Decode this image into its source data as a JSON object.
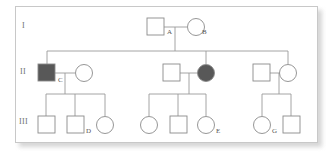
{
  "figure": {
    "type": "pedigree-chart",
    "background": "#ffffff",
    "frame_border_color": "#c8c8c8",
    "symbol_stroke_color": "#8a8a8a",
    "line_color": "#9a9a9a",
    "affected_fill_color": "#585858",
    "unaffected_fill_color": "#ffffff",
    "label_color": "#555555"
  },
  "generations": [
    {
      "id": "gen-1",
      "numeral": "I"
    },
    {
      "id": "gen-2",
      "numeral": "II"
    },
    {
      "id": "gen-3",
      "numeral": "III"
    }
  ],
  "legend_semantics": {
    "square": "male",
    "circle": "female",
    "filled": "affected",
    "open": "unaffected"
  },
  "individuals": [
    {
      "id": "I-1",
      "label": "A",
      "sex": "male",
      "shape": "square",
      "affected": false,
      "generation": "I",
      "x": 156,
      "y": 26
    },
    {
      "id": "I-2",
      "label": "B",
      "sex": "female",
      "shape": "circle",
      "affected": false,
      "generation": "I",
      "x": 190,
      "y": 26
    },
    {
      "id": "II-1",
      "label": "C",
      "sex": "male",
      "shape": "square",
      "affected": true,
      "generation": "II",
      "x": 47,
      "y": 73
    },
    {
      "id": "II-2",
      "label": "",
      "sex": "female",
      "shape": "circle",
      "affected": false,
      "generation": "II",
      "x": 82,
      "y": 73
    },
    {
      "id": "II-3",
      "label": "",
      "sex": "male",
      "shape": "square",
      "affected": false,
      "generation": "II",
      "x": 172,
      "y": 73
    },
    {
      "id": "II-4",
      "label": "",
      "sex": "female",
      "shape": "circle",
      "affected": true,
      "generation": "II",
      "x": 206,
      "y": 73
    },
    {
      "id": "II-5",
      "label": "",
      "sex": "male",
      "shape": "square",
      "affected": false,
      "generation": "II",
      "x": 262,
      "y": 73
    },
    {
      "id": "II-6",
      "label": "",
      "sex": "female",
      "shape": "circle",
      "affected": false,
      "generation": "II",
      "x": 288,
      "y": 73
    },
    {
      "id": "III-1",
      "label": "",
      "sex": "male",
      "shape": "square",
      "affected": false,
      "generation": "III",
      "x": 46,
      "y": 124
    },
    {
      "id": "III-2",
      "label": "D",
      "sex": "male",
      "shape": "square",
      "affected": false,
      "generation": "III",
      "x": 75,
      "y": 124
    },
    {
      "id": "III-3",
      "label": "",
      "sex": "female",
      "shape": "circle",
      "affected": false,
      "generation": "III",
      "x": 105,
      "y": 124
    },
    {
      "id": "III-4",
      "label": "",
      "sex": "female",
      "shape": "circle",
      "affected": false,
      "generation": "III",
      "x": 149,
      "y": 124
    },
    {
      "id": "III-5",
      "label": "",
      "sex": "male",
      "shape": "square",
      "affected": false,
      "generation": "III",
      "x": 178,
      "y": 124
    },
    {
      "id": "III-6",
      "label": "E",
      "sex": "female",
      "shape": "circle",
      "affected": false,
      "generation": "III",
      "x": 206,
      "y": 124
    },
    {
      "id": "III-7",
      "label": "G",
      "sex": "female",
      "shape": "circle",
      "affected": false,
      "generation": "III",
      "x": 262,
      "y": 124
    },
    {
      "id": "III-8",
      "label": "",
      "sex": "male",
      "shape": "square",
      "affected": false,
      "generation": "III",
      "x": 291,
      "y": 124
    }
  ],
  "id_labels": [
    {
      "text": "A",
      "left": 167,
      "top": 28
    },
    {
      "text": "B",
      "left": 202,
      "top": 28
    },
    {
      "text": "C",
      "left": 58,
      "top": 76
    },
    {
      "text": "D",
      "left": 86,
      "top": 127
    },
    {
      "text": "E",
      "left": 216,
      "top": 127
    },
    {
      "text": "G",
      "left": 272,
      "top": 127
    }
  ],
  "matings": [
    {
      "id": "mating-A-B",
      "partners": [
        "I-1",
        "I-2"
      ],
      "children": [
        "II-1",
        "II-4",
        "II-6"
      ]
    },
    {
      "id": "mating-C",
      "partners": [
        "II-1",
        "II-2"
      ],
      "children": [
        "III-1",
        "III-2",
        "III-3"
      ]
    },
    {
      "id": "mating-mid",
      "partners": [
        "II-3",
        "II-4"
      ],
      "children": [
        "III-4",
        "III-5",
        "III-6"
      ]
    },
    {
      "id": "mating-right",
      "partners": [
        "II-5",
        "II-6"
      ],
      "children": [
        "III-7",
        "III-8"
      ]
    }
  ]
}
